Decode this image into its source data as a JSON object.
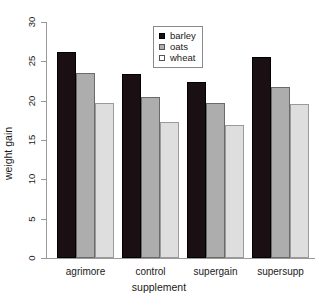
{
  "chart_data": {
    "type": "bar",
    "title": "",
    "subtitle": "",
    "xlabel": "supplement",
    "ylabel": "weight gain",
    "categories": [
      "agrimore",
      "control",
      "supergain",
      "supersupp"
    ],
    "series": [
      {
        "name": "barley",
        "color": "#1a1013",
        "values": [
          26.2,
          23.4,
          22.4,
          25.5
        ]
      },
      {
        "name": "oats",
        "color": "#adadad",
        "values": [
          23.5,
          20.5,
          19.7,
          21.8
        ]
      },
      {
        "name": "wheat",
        "color": "#dedede",
        "values": [
          19.7,
          17.3,
          16.9,
          19.6
        ]
      }
    ],
    "ylim": [
      0,
      30
    ],
    "yticks": [
      0,
      5,
      10,
      15,
      20,
      25,
      30
    ],
    "ytick_labels": [
      "0",
      "5",
      "10",
      "15",
      "20",
      "25",
      "30"
    ],
    "grid": false,
    "legend": {
      "position": "top-center",
      "entries": [
        "barley",
        "oats",
        "wheat"
      ]
    },
    "bar_outline_color": "#000000",
    "axis_color": "#9a9a9a",
    "background": "#ffffff"
  }
}
